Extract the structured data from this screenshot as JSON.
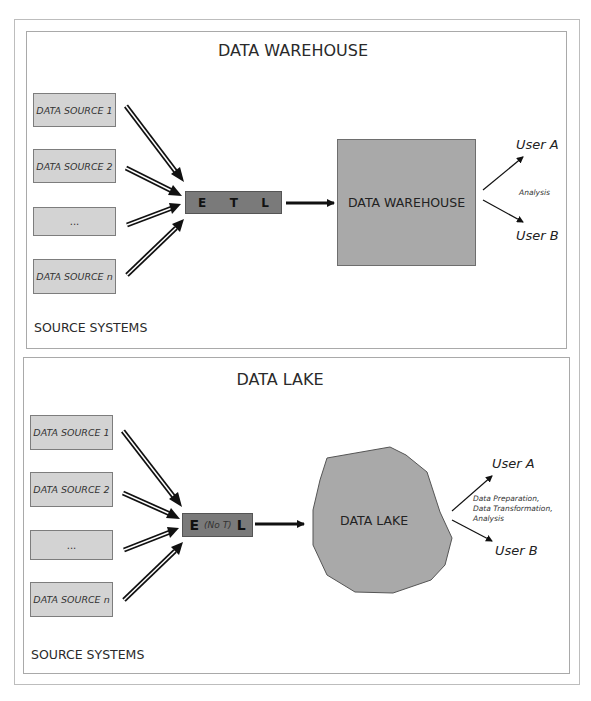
{
  "warehouse": {
    "title": "DATA WAREHOUSE",
    "sources": [
      "DATA SOURCE 1",
      "DATA SOURCE 2",
      "...",
      "DATA SOURCE n"
    ],
    "source_systems_label": "SOURCE SYSTEMS",
    "etl": {
      "e": "E",
      "t": "T",
      "l": "L"
    },
    "store_label": "DATA WAREHOUSE",
    "user_a": "User A",
    "user_b": "User B",
    "usage_note": "Analysis"
  },
  "lake": {
    "title": "DATA LAKE",
    "sources": [
      "DATA SOURCE 1",
      "DATA SOURCE 2",
      "...",
      "DATA SOURCE n"
    ],
    "source_systems_label": "SOURCE SYSTEMS",
    "etl": {
      "e": "E",
      "t": "(No T)",
      "l": "L"
    },
    "store_label": "DATA LAKE",
    "user_a": "User A",
    "user_b": "User B",
    "usage_note_lines": [
      "Data Preparation,",
      "Data Transformation,",
      "Analysis"
    ]
  },
  "colors": {
    "source_fill": "#d3d3d3",
    "etl_fill": "#7a7a7a",
    "store_fill": "#a9a9a9",
    "border": "#a9a9a9"
  }
}
